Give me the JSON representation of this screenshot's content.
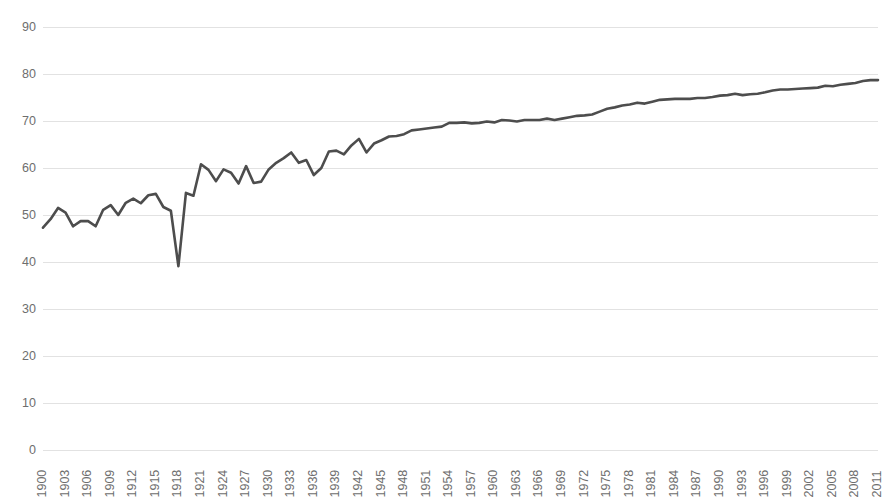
{
  "chart_data": {
    "type": "line",
    "title": "",
    "subtitle": "",
    "xlabel": "",
    "ylabel": "",
    "xlim": [
      1900,
      2011
    ],
    "ylim": [
      0,
      90
    ],
    "grid": true,
    "legend": "none",
    "line_color": "#4d4d4d",
    "line_width": 2.6,
    "background_color": "#ffffff",
    "gridline_color": "#e2e2e2",
    "tick_label_color": "#6e6e6e",
    "y_ticks": [
      0,
      10,
      20,
      30,
      40,
      50,
      60,
      70,
      80,
      90
    ],
    "x_ticks": [
      1900,
      1903,
      1906,
      1909,
      1912,
      1915,
      1918,
      1921,
      1924,
      1927,
      1930,
      1933,
      1936,
      1939,
      1942,
      1945,
      1948,
      1951,
      1954,
      1957,
      1960,
      1963,
      1966,
      1969,
      1972,
      1975,
      1978,
      1981,
      1984,
      1987,
      1990,
      1993,
      1996,
      1999,
      2002,
      2005,
      2008,
      2011
    ],
    "x_tick_rotation": -90,
    "series": [
      {
        "name": "Life expectancy at birth",
        "x": [
          1900,
          1901,
          1902,
          1903,
          1904,
          1905,
          1906,
          1907,
          1908,
          1909,
          1910,
          1911,
          1912,
          1913,
          1914,
          1915,
          1916,
          1917,
          1918,
          1919,
          1920,
          1921,
          1922,
          1923,
          1924,
          1925,
          1926,
          1927,
          1928,
          1929,
          1930,
          1931,
          1932,
          1933,
          1934,
          1935,
          1936,
          1937,
          1938,
          1939,
          1940,
          1941,
          1942,
          1943,
          1944,
          1945,
          1946,
          1947,
          1948,
          1949,
          1950,
          1951,
          1952,
          1953,
          1954,
          1955,
          1956,
          1957,
          1958,
          1959,
          1960,
          1961,
          1962,
          1963,
          1964,
          1965,
          1966,
          1967,
          1968,
          1969,
          1970,
          1971,
          1972,
          1973,
          1974,
          1975,
          1976,
          1977,
          1978,
          1979,
          1980,
          1981,
          1982,
          1983,
          1984,
          1985,
          1986,
          1987,
          1988,
          1989,
          1990,
          1991,
          1992,
          1993,
          1994,
          1995,
          1996,
          1997,
          1998,
          1999,
          2000,
          2001,
          2002,
          2003,
          2004,
          2005,
          2006,
          2007,
          2008,
          2009,
          2010,
          2011
        ],
        "values": [
          47.3,
          49.1,
          51.5,
          50.5,
          47.6,
          48.7,
          48.7,
          47.6,
          51.1,
          52.1,
          50.0,
          52.6,
          53.5,
          52.5,
          54.2,
          54.5,
          51.7,
          50.9,
          39.1,
          54.7,
          54.1,
          60.8,
          59.6,
          57.2,
          59.7,
          59.0,
          56.7,
          60.4,
          56.8,
          57.1,
          59.7,
          61.1,
          62.1,
          63.3,
          61.1,
          61.7,
          58.5,
          60.0,
          63.5,
          63.7,
          62.9,
          64.8,
          66.2,
          63.3,
          65.2,
          65.9,
          66.7,
          66.8,
          67.2,
          68.0,
          68.2,
          68.4,
          68.6,
          68.8,
          69.6,
          69.6,
          69.7,
          69.5,
          69.6,
          69.9,
          69.7,
          70.2,
          70.1,
          69.9,
          70.2,
          70.2,
          70.2,
          70.5,
          70.2,
          70.5,
          70.8,
          71.1,
          71.2,
          71.4,
          72.0,
          72.6,
          72.9,
          73.3,
          73.5,
          73.9,
          73.7,
          74.1,
          74.5,
          74.6,
          74.7,
          74.7,
          74.7,
          74.9,
          74.9,
          75.1,
          75.4,
          75.5,
          75.8,
          75.5,
          75.7,
          75.8,
          76.1,
          76.5,
          76.7,
          76.7,
          76.8,
          76.9,
          77.0,
          77.1,
          77.5,
          77.4,
          77.7,
          77.9,
          78.1,
          78.5,
          78.7,
          78.7
        ]
      }
    ]
  }
}
